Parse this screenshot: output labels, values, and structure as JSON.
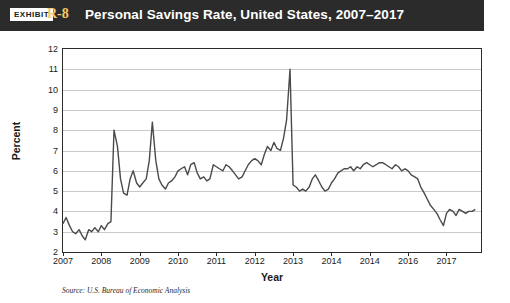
{
  "header": {
    "exhibit_label": "EXHIBIT",
    "exhibit_number": "R-8",
    "title": "Personal Savings Rate, United States, 2007–2017"
  },
  "source_note": "Source: U.S. Bureau of Economic Analysis",
  "chart_data": {
    "type": "line",
    "title": "Personal Savings Rate, United States, 2007–2017",
    "xlabel": "Year",
    "ylabel": "Percent",
    "xlim": [
      2007,
      2017.9
    ],
    "ylim": [
      2,
      12
    ],
    "yticks": [
      "2",
      "3",
      "4",
      "5",
      "6",
      "7",
      "8",
      "9",
      "10",
      "11",
      "12"
    ],
    "xticks": [
      "2007",
      "2008",
      "2009",
      "2010",
      "2011",
      "2012",
      "2013",
      "2014",
      "2014",
      "2016",
      "2017"
    ],
    "xtick_values": [
      2007,
      2008,
      2009,
      2010,
      2011,
      2012,
      2013,
      2014,
      2015,
      2016,
      2017
    ],
    "grid": "horizontal",
    "legend": "none",
    "line_color": "#4a4a4a",
    "series": [
      {
        "name": "Personal Savings Rate",
        "x": [
          2007.0,
          2007.08,
          2007.17,
          2007.25,
          2007.33,
          2007.42,
          2007.5,
          2007.58,
          2007.67,
          2007.75,
          2007.83,
          2007.92,
          2008.0,
          2008.08,
          2008.17,
          2008.25,
          2008.33,
          2008.42,
          2008.5,
          2008.58,
          2008.67,
          2008.75,
          2008.83,
          2008.92,
          2009.0,
          2009.08,
          2009.17,
          2009.25,
          2009.33,
          2009.42,
          2009.5,
          2009.58,
          2009.67,
          2009.75,
          2009.83,
          2009.92,
          2010.0,
          2010.08,
          2010.17,
          2010.25,
          2010.33,
          2010.42,
          2010.5,
          2010.58,
          2010.67,
          2010.75,
          2010.83,
          2010.92,
          2011.0,
          2011.08,
          2011.17,
          2011.25,
          2011.33,
          2011.42,
          2011.5,
          2011.58,
          2011.67,
          2011.75,
          2011.83,
          2011.92,
          2012.0,
          2012.08,
          2012.17,
          2012.25,
          2012.33,
          2012.42,
          2012.5,
          2012.58,
          2012.67,
          2012.75,
          2012.83,
          2012.92,
          2013.0,
          2013.08,
          2013.17,
          2013.25,
          2013.33,
          2013.42,
          2013.5,
          2013.58,
          2013.67,
          2013.75,
          2013.83,
          2013.92,
          2014.0,
          2014.08,
          2014.17,
          2014.25,
          2014.33,
          2014.42,
          2014.5,
          2014.58,
          2014.67,
          2014.75,
          2014.83,
          2014.92,
          2015.0,
          2015.08,
          2015.17,
          2015.25,
          2015.33,
          2015.42,
          2015.5,
          2015.58,
          2015.67,
          2015.75,
          2015.83,
          2015.92,
          2016.0,
          2016.08,
          2016.17,
          2016.25,
          2016.33,
          2016.42,
          2016.5,
          2016.58,
          2016.67,
          2016.75,
          2016.83,
          2016.92,
          2017.0,
          2017.08,
          2017.17,
          2017.25,
          2017.33,
          2017.42,
          2017.5,
          2017.58,
          2017.67,
          2017.75
        ],
        "values": [
          3.4,
          3.7,
          3.3,
          3.0,
          2.9,
          3.1,
          2.8,
          2.6,
          3.1,
          3.0,
          3.2,
          3.0,
          3.3,
          3.1,
          3.4,
          3.5,
          8.0,
          7.2,
          5.6,
          4.9,
          4.8,
          5.6,
          6.0,
          5.4,
          5.2,
          5.4,
          5.6,
          6.5,
          8.4,
          6.5,
          5.6,
          5.3,
          5.1,
          5.4,
          5.5,
          5.7,
          6.0,
          6.1,
          6.2,
          5.8,
          6.3,
          6.4,
          5.9,
          5.6,
          5.7,
          5.5,
          5.6,
          6.3,
          6.2,
          6.1,
          6.0,
          6.3,
          6.2,
          6.0,
          5.8,
          5.6,
          5.7,
          6.0,
          6.3,
          6.5,
          6.6,
          6.5,
          6.3,
          6.8,
          7.2,
          7.0,
          7.4,
          7.1,
          7.0,
          7.6,
          8.5,
          11.0,
          5.3,
          5.2,
          5.0,
          5.1,
          5.0,
          5.2,
          5.6,
          5.8,
          5.5,
          5.2,
          5.0,
          5.1,
          5.4,
          5.6,
          5.9,
          6.0,
          6.1,
          6.1,
          6.2,
          6.0,
          6.2,
          6.1,
          6.3,
          6.4,
          6.3,
          6.2,
          6.3,
          6.4,
          6.4,
          6.3,
          6.2,
          6.1,
          6.3,
          6.2,
          6.0,
          6.1,
          6.0,
          5.8,
          5.7,
          5.6,
          5.2,
          4.9,
          4.6,
          4.3,
          4.1,
          3.9,
          3.6,
          3.3,
          3.9,
          4.1,
          4.0,
          3.8,
          4.1,
          4.0,
          3.9,
          4.0,
          4.0,
          4.1
        ]
      }
    ]
  }
}
